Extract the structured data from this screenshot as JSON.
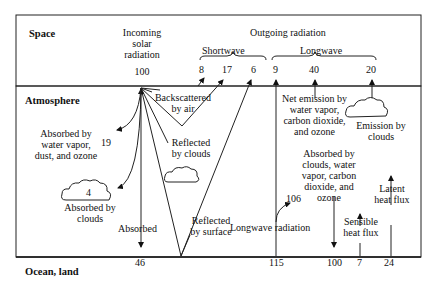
{
  "zones": {
    "space": "Space",
    "atmosphere": "Atmosphere",
    "surface": "Ocean, land"
  },
  "incoming": {
    "label_line1": "Incoming",
    "label_line2": "solar",
    "label_line3": "radiation",
    "value": "100"
  },
  "outgoing": {
    "title": "Outgoing radiation",
    "shortwave_label": "Shortwave",
    "longwave_label": "Longwave",
    "shortwave_values": [
      "8",
      "17",
      "6"
    ],
    "longwave_values": [
      "9",
      "40",
      "20"
    ]
  },
  "atmosphere_labels": {
    "backscattered_line1": "Backscattered",
    "backscattered_line2": "by air",
    "absorbed_wv_line1": "Absorbed by",
    "absorbed_wv_line2": "water vapor,",
    "absorbed_wv_line3": "dust, and ozone",
    "absorbed_wv_value": "19",
    "reflected_clouds_line1": "Reflected",
    "reflected_clouds_line2": "by clouds",
    "absorbed_clouds_value": "4",
    "absorbed_clouds_line1": "Absorbed by",
    "absorbed_clouds_line2": "clouds",
    "reflected_surface_line1": "Reflected",
    "reflected_surface_line2": "by surface",
    "absorbed": "Absorbed",
    "net_emission_line1": "Net emission by",
    "net_emission_line2": "water vapor,",
    "net_emission_line3": "carbon dioxide,",
    "net_emission_line4": "and ozone",
    "emission_clouds_line1": "Emission by",
    "emission_clouds_line2": "clouds",
    "absorbed_cwv_line1": "Absorbed by",
    "absorbed_cwv_line2": "clouds, water",
    "absorbed_cwv_line3": "vapor, carbon",
    "absorbed_cwv_line4": "dioxide, and",
    "absorbed_cwv_line5": "ozone",
    "absorbed_cwv_value": "106",
    "longwave_radiation": "Longwave radiation",
    "sensible_line1": "Sensible",
    "sensible_line2": "heat flux",
    "latent_line1": "Latent",
    "latent_line2": "heat flux"
  },
  "surface_values": {
    "absorbed": "46",
    "longwave": "115",
    "back_radiation": "100",
    "sensible": "7",
    "latent": "24"
  }
}
